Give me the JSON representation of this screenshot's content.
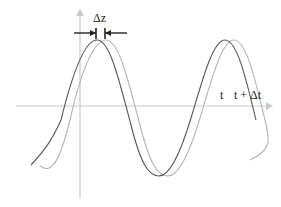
{
  "diagram": {
    "title": "",
    "labels": {
      "delta_z": "Δz",
      "t": "t",
      "t_plus_dt": "t + Δt"
    },
    "colors": {
      "axis": "#c8c8c8",
      "wave_t": "#555555",
      "wave_t_dt": "#b4b4b4",
      "marker": "#222222",
      "background": "#ffffff"
    },
    "waves": [
      {
        "name": "wave at t",
        "phase_shift_px": 0
      },
      {
        "name": "wave at t + Δt",
        "phase_shift_px": 9
      }
    ]
  }
}
